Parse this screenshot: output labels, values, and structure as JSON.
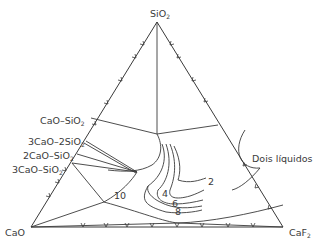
{
  "diagram": {
    "type": "ternary phase diagram",
    "vertices": {
      "top": "SiO",
      "top_sub": "2",
      "left": "CaO",
      "right": "CaF",
      "right_sub": "2"
    },
    "compounds": [
      {
        "main": "CaO–SiO",
        "sub": "2"
      },
      {
        "main": "3CaO–2SiO",
        "sub": "2"
      },
      {
        "main": "2CaO–SiO",
        "sub": "2"
      },
      {
        "main": "3CaO–SiO",
        "sub": "2"
      }
    ],
    "region_label": "Dois líquidos",
    "isotherm_labels": [
      "2",
      "4",
      "6",
      "8",
      "10"
    ]
  }
}
